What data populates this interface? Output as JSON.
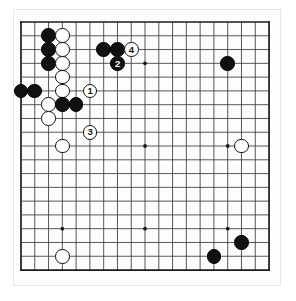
{
  "diagram": {
    "kind": "go-board-diagram",
    "board_size": 19,
    "title": "",
    "caption": "",
    "geometry": {
      "origin_x": 21,
      "origin_y": 22,
      "spacing": 13.78,
      "stone_diameter": 14.6,
      "frame_left": 13,
      "frame_top": 9,
      "frame_width": 268,
      "frame_height": 277
    },
    "colors": {
      "background": "#ffffff",
      "board_fill": "#fdfdfb",
      "grid_line": "#3a3a3a",
      "border_line": "#1a1a1a",
      "black_stone": "#111111",
      "white_stone": "#ffffff",
      "stone_outline": "#111111",
      "frame_line": "#e6e6e2"
    },
    "star_points": [
      {
        "col": 4,
        "row": 4
      },
      {
        "col": 10,
        "row": 4
      },
      {
        "col": 16,
        "row": 4
      },
      {
        "col": 4,
        "row": 10
      },
      {
        "col": 10,
        "row": 10
      },
      {
        "col": 16,
        "row": 10
      },
      {
        "col": 4,
        "row": 16
      },
      {
        "col": 10,
        "row": 16
      },
      {
        "col": 16,
        "row": 16
      }
    ],
    "stones": [
      {
        "col": 3,
        "row": 2,
        "color": "black",
        "label": ""
      },
      {
        "col": 4,
        "row": 2,
        "color": "white",
        "label": ""
      },
      {
        "col": 3,
        "row": 3,
        "color": "black",
        "label": ""
      },
      {
        "col": 4,
        "row": 3,
        "color": "white",
        "label": ""
      },
      {
        "col": 7,
        "row": 3,
        "color": "black",
        "label": ""
      },
      {
        "col": 8,
        "row": 3,
        "color": "black",
        "label": ""
      },
      {
        "col": 9,
        "row": 3,
        "color": "white",
        "label": "4"
      },
      {
        "col": 3,
        "row": 4,
        "color": "black",
        "label": ""
      },
      {
        "col": 4,
        "row": 4,
        "color": "white",
        "label": ""
      },
      {
        "col": 8,
        "row": 4,
        "color": "black",
        "label": "2"
      },
      {
        "col": 16,
        "row": 4,
        "color": "black",
        "label": ""
      },
      {
        "col": 4,
        "row": 5,
        "color": "white",
        "label": ""
      },
      {
        "col": 1,
        "row": 6,
        "color": "black",
        "label": ""
      },
      {
        "col": 2,
        "row": 6,
        "color": "black",
        "label": ""
      },
      {
        "col": 4,
        "row": 6,
        "color": "white",
        "label": ""
      },
      {
        "col": 6,
        "row": 6,
        "color": "white",
        "label": "1"
      },
      {
        "col": 3,
        "row": 7,
        "color": "white",
        "label": ""
      },
      {
        "col": 4,
        "row": 7,
        "color": "black",
        "label": ""
      },
      {
        "col": 5,
        "row": 7,
        "color": "black",
        "label": ""
      },
      {
        "col": 3,
        "row": 8,
        "color": "white",
        "label": ""
      },
      {
        "col": 6,
        "row": 9,
        "color": "white",
        "label": "3"
      },
      {
        "col": 4,
        "row": 10,
        "color": "white",
        "label": ""
      },
      {
        "col": 17,
        "row": 10,
        "color": "white",
        "label": ""
      },
      {
        "col": 4,
        "row": 18,
        "color": "white",
        "label": ""
      },
      {
        "col": 15,
        "row": 18,
        "color": "black",
        "label": ""
      },
      {
        "col": 17,
        "row": 17,
        "color": "black",
        "label": ""
      }
    ],
    "move_markers": [
      {
        "number": "1",
        "color": "white",
        "col": 6,
        "row": 6
      },
      {
        "number": "2",
        "color": "black",
        "col": 8,
        "row": 4
      },
      {
        "number": "3",
        "color": "white",
        "col": 6,
        "row": 9
      },
      {
        "number": "4",
        "color": "white",
        "col": 9,
        "row": 3
      }
    ],
    "labels": {
      "move_1": "1",
      "move_2": "2",
      "move_3": "3",
      "move_4": "4"
    }
  }
}
